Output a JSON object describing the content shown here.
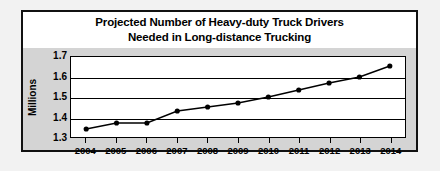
{
  "chart_data": {
    "type": "line",
    "title": "Projected Number of Heavy-duty Truck Drivers Needed in Long-distance Trucking",
    "title_lines": [
      "Projected Number of Heavy-duty Truck Drivers",
      "Needed in Long-distance Trucking"
    ],
    "xlabel": "",
    "ylabel": "Millions",
    "categories": [
      "2004",
      "2005",
      "2006",
      "2007",
      "2008",
      "2009",
      "2010",
      "2011",
      "2012",
      "2013",
      "2014"
    ],
    "values": [
      1.34,
      1.37,
      1.37,
      1.43,
      1.45,
      1.47,
      1.5,
      1.535,
      1.57,
      1.6,
      1.655
    ],
    "ylim": [
      1.3,
      1.7
    ],
    "yticks": [
      "1.3",
      "1.4",
      "1.5",
      "1.6",
      "1.7"
    ],
    "ytick_values": [
      1.3,
      1.4,
      1.5,
      1.6,
      1.7
    ],
    "grid": true,
    "legend": "none",
    "marker": "filled-circle",
    "series_color": "#000000",
    "plot_background": "#ffffff",
    "panel_background": "#d4d4d4",
    "border_color": "#111111"
  }
}
